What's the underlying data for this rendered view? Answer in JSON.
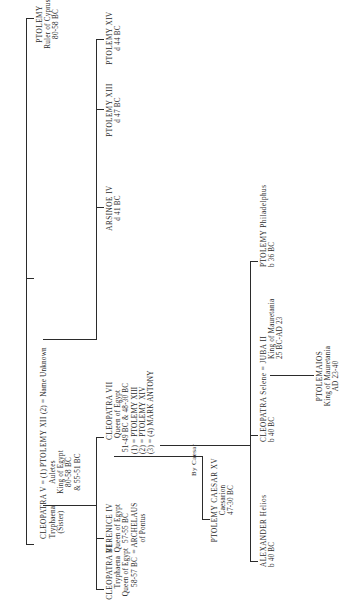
{
  "diagram": {
    "type": "family-tree",
    "orientation": "rotated 90deg clockwise (text reads bottom-to-top)",
    "generation_1": {
      "ptolemy_cyprus": {
        "name": "PTOLEMY",
        "lines": [
          "Ruler of Cyprus",
          "80-58 BC"
        ]
      },
      "cleopatra_v": {
        "name": "CLEOPATRA V",
        "lines": [
          "Tryphaena",
          "(Sister)"
        ]
      },
      "marriage_1_sign": "= (1)",
      "ptolemy_xii": {
        "name": "PTOLEMY XII",
        "lines": [
          "Auletes",
          "King of Egypt",
          "80-58 BC",
          "& 55-51 BC"
        ]
      },
      "marriage_2_sign": "(2) =",
      "name_unknown": {
        "name": "Name Unknown"
      }
    },
    "generation_2": {
      "cleopatra_vi": {
        "name": "CLEOPATRA VI",
        "lines": [
          "Tryphaena",
          "Queen of Egypt",
          "58-57 BC"
        ]
      },
      "berenice_iv": {
        "name": "BERENICE IV",
        "lines": [
          "Queen of Egypt",
          "57-55 BC",
          "= ARCHELAUS",
          "of Pontus"
        ]
      },
      "cleopatra_vii": {
        "name": "CLEOPATRA VII",
        "lines": [
          "Queen of Egypt",
          "51-49 BC & 48-30 BC",
          "(1) = PTOLEMY XIII",
          "(2) = PTOLEMY XIV",
          "(3) = (4) MARK ANTONY"
        ]
      },
      "arsinoe_iv": {
        "name": "ARSINOE IV",
        "lines": [
          "d 41 BC"
        ]
      },
      "ptolemy_xiii": {
        "name": "PTOLEMY XIII",
        "lines": [
          "d 47 BC"
        ]
      },
      "ptolemy_xiv": {
        "name": "PTOLEMY XIV",
        "lines": [
          "d 44 BC"
        ]
      }
    },
    "generation_3": {
      "by_caesar_label": "By Caesar",
      "caesarion": {
        "name": "PTOLEMY CAESAR XV",
        "lines": [
          "Caesarion",
          "47-30 BC"
        ]
      },
      "alexander_helios": {
        "name": "ALEXANDER Helios",
        "lines": [
          "b 40 BC"
        ]
      },
      "cleopatra_selene": {
        "name": "CLEOPATRA Selene = JUBA II",
        "lines": [
          "b 40 BC"
        ]
      },
      "juba_ii": {
        "lines": [
          "King of Mauretania",
          "25 BC-AD 23"
        ]
      },
      "ptolemy_philadelphus": {
        "name": "PTOLEMY Philadelphus",
        "lines": [
          "b 36 BC"
        ]
      }
    },
    "generation_4": {
      "ptolemaios": {
        "name": "PTOLEMAIOS",
        "lines": [
          "King of Mauretania",
          "AD 23-40"
        ]
      }
    }
  }
}
